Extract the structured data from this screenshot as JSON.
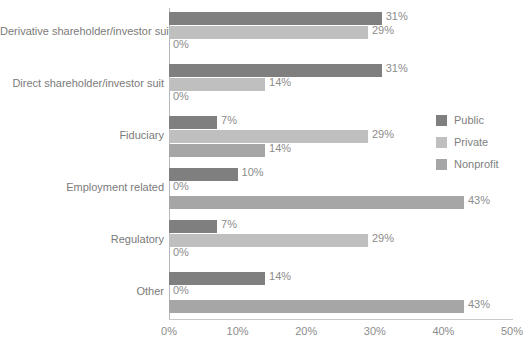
{
  "chart_data": {
    "type": "bar",
    "orientation": "horizontal",
    "title": "",
    "subtitle": "",
    "xlabel": "",
    "ylabel": "",
    "xlim": [
      0,
      50
    ],
    "grid": false,
    "legend_position": "right",
    "xticks": [
      "0%",
      "10%",
      "20%",
      "30%",
      "40%",
      "50%"
    ],
    "xtick_values": [
      0,
      10,
      20,
      30,
      40,
      50
    ],
    "categories": [
      "Derivative shareholder/investor suit",
      "Direct shareholder/investor suit",
      "Fiduciary",
      "Employment related",
      "Regulatory",
      "Other"
    ],
    "series": [
      {
        "name": "Public",
        "color": "#7f7f7f",
        "values": [
          31,
          31,
          7,
          10,
          7,
          14
        ],
        "labels": [
          "31%",
          "31%",
          "7%",
          "10%",
          "7%",
          "14%"
        ]
      },
      {
        "name": "Private",
        "color": "#bfbfbf",
        "values": [
          29,
          14,
          29,
          0,
          29,
          0
        ],
        "labels": [
          "29%",
          "14%",
          "29%",
          "0%",
          "29%",
          "0%"
        ]
      },
      {
        "name": "Nonprofit",
        "color": "#a6a6a6",
        "values": [
          0,
          0,
          14,
          43,
          0,
          43
        ],
        "labels": [
          "0%",
          "0%",
          "14%",
          "43%",
          "0%",
          "43%"
        ]
      }
    ]
  },
  "legend": {
    "items": [
      {
        "label": "Public",
        "color": "#7f7f7f"
      },
      {
        "label": "Private",
        "color": "#bfbfbf"
      },
      {
        "label": "Nonprofit",
        "color": "#a6a6a6"
      }
    ]
  },
  "axis": {
    "tick_labels": [
      "0%",
      "10%",
      "20%",
      "30%",
      "40%",
      "50%"
    ]
  }
}
